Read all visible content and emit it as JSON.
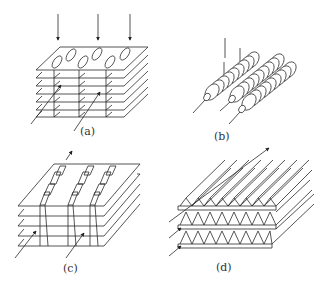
{
  "figure": {
    "panels": [
      {
        "id": "a",
        "label": "(a)",
        "description": "Stacked parallel plates with elliptical openings; vertical flow arrows entering from top, diagonal arrows crossing plates"
      },
      {
        "id": "b",
        "label": "(b)",
        "description": "Three tubes with circular annular fins (finned-tube bundle), axial lines extending out"
      },
      {
        "id": "c",
        "label": "(c)",
        "description": "Stacked plates with louvered/bent tabs rows; upward arrow and diagonal arrows"
      },
      {
        "id": "d",
        "label": "(d)",
        "description": "Corrugated (triangular) fins sandwiched between flat plates; diagonal arrows"
      }
    ],
    "colors": {
      "stroke": "#2a2a2a",
      "background": "#ffffff",
      "label": "#333333"
    }
  }
}
